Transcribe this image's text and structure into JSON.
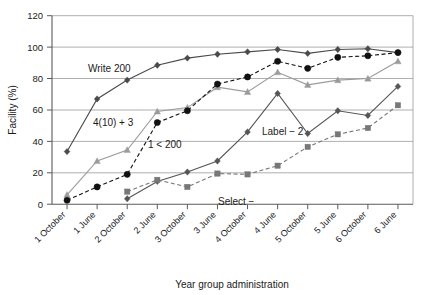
{
  "chart_data": {
    "type": "line",
    "title": "",
    "xlabel": "Year group administration",
    "ylabel": "Facility (%)",
    "ylim": [
      0,
      120
    ],
    "ytick_values": [
      0,
      20,
      40,
      60,
      80,
      100,
      120
    ],
    "ytick_labels": [
      "0",
      "20",
      "40",
      "60",
      "80",
      "100",
      "120"
    ],
    "grid": true,
    "legend_position": "inline-annotations",
    "categories": [
      "1 October",
      "1 June",
      "2 October",
      "2 June",
      "3 October",
      "3 June",
      "4 October",
      "4 June",
      "5 October",
      "5 June",
      "6 October",
      "6 June"
    ],
    "series": [
      {
        "name": "Write 200",
        "marker": "diamond",
        "line_style": "solid",
        "color": "#4a4a4a",
        "values": [
          33.5,
          67,
          79,
          88.5,
          93,
          95.5,
          97,
          98.5,
          96,
          98.5,
          99,
          96.5
        ]
      },
      {
        "name": "4(10) + 3",
        "marker": "triangle",
        "line_style": "solid",
        "color": "#9b9b9b",
        "values": [
          6,
          27.5,
          34.5,
          59,
          61.5,
          74.5,
          71.5,
          84,
          76,
          79,
          80,
          91
        ]
      },
      {
        "name": "1 < 200",
        "marker": "circle",
        "line_style": "dashed",
        "color": "#111111",
        "values": [
          2.5,
          11,
          19,
          52,
          59.5,
          76.5,
          81,
          91,
          86.5,
          93.5,
          94.5,
          96.5
        ]
      },
      {
        "name": "Label − 2",
        "marker": "diamond",
        "line_style": "solid",
        "color": "#555555",
        "values": [
          null,
          null,
          3.5,
          14.5,
          20.5,
          27.5,
          46,
          70.5,
          45,
          59.5,
          56.5,
          75
        ]
      },
      {
        "name": "Select −",
        "marker": "square",
        "line_style": "dashed",
        "color": "#777777",
        "values": [
          null,
          null,
          8,
          15.5,
          11,
          19.5,
          19,
          24.5,
          36.5,
          44.5,
          48.5,
          63
        ]
      }
    ],
    "annotations": [
      {
        "text": "Write 200",
        "x_px": 88,
        "y_px": 72
      },
      {
        "text": "4(10) + 3",
        "x_px": 93,
        "y_px": 126
      },
      {
        "text": "1 < 200",
        "x_px": 148,
        "y_px": 148
      },
      {
        "text": "Label − 2",
        "x_px": 262,
        "y_px": 135
      },
      {
        "text": "Select −",
        "x_px": 218,
        "y_px": 205
      }
    ],
    "extra_series_points": [
      {
        "series": "Label − 2",
        "note": "4 June peak then dip at 5 October"
      },
      {
        "series": "1 < 200",
        "note": "duplicate marker near 4 October at 76"
      }
    ]
  }
}
